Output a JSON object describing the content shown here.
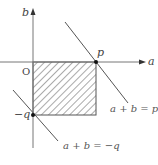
{
  "diagram": {
    "axes": {
      "x_label": "a",
      "y_label": "b",
      "origin_label": "O"
    },
    "points": [
      {
        "name": "p",
        "label": "p",
        "coords": [
          1,
          0
        ]
      },
      {
        "name": "neg-q",
        "label": "−q",
        "coords": [
          0,
          -1
        ]
      }
    ],
    "lines": [
      {
        "name": "line-p",
        "label": "a + b = p"
      },
      {
        "name": "line-neg-q",
        "label": "a + b = −q"
      }
    ],
    "region": {
      "description": "hatched rectangle 0 ≤ a ≤ p, −q ≤ b ≤ 0"
    },
    "colors": {
      "stroke": "#555555",
      "axis": "#777777",
      "hatch": "#555555"
    }
  }
}
